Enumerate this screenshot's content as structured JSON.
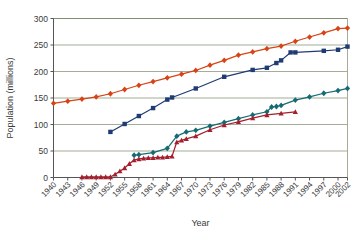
{
  "chart_data": {
    "type": "line",
    "title": "",
    "xlabel": "Year",
    "ylabel": "Population (millions)",
    "xlim": [
      1940,
      2002
    ],
    "ylim": [
      0,
      300
    ],
    "ytick_values": [
      0,
      50,
      100,
      150,
      200,
      250,
      300
    ],
    "ytick_labels": [
      "0",
      "50",
      "100",
      "150",
      "200",
      "250",
      "300"
    ],
    "xtick_labels": [
      "1940",
      "1943",
      "1946",
      "1949",
      "1952",
      "1955",
      "1958",
      "1961",
      "1964",
      "1967",
      "1970",
      "1973",
      "1976",
      "1979",
      "1982",
      "1985",
      "1988",
      "1991",
      "1994",
      "1997",
      "2000",
      "2002"
    ],
    "grid": "horizontal",
    "legend": "none",
    "series": [
      {
        "name": "series-red-diamond",
        "color": "#d84315",
        "marker": "diamond",
        "points": [
          [
            1940,
            140
          ],
          [
            1943,
            144
          ],
          [
            1946,
            148
          ],
          [
            1949,
            152
          ],
          [
            1952,
            158
          ],
          [
            1955,
            166
          ],
          [
            1958,
            174
          ],
          [
            1961,
            181
          ],
          [
            1964,
            188
          ],
          [
            1967,
            195
          ],
          [
            1970,
            202
          ],
          [
            1973,
            212
          ],
          [
            1976,
            221
          ],
          [
            1979,
            231
          ],
          [
            1982,
            237
          ],
          [
            1985,
            243
          ],
          [
            1988,
            248
          ],
          [
            1991,
            257
          ],
          [
            1994,
            265
          ],
          [
            1997,
            273
          ],
          [
            2000,
            281
          ],
          [
            2002,
            282
          ]
        ]
      },
      {
        "name": "series-navy-square",
        "color": "#1f3b73",
        "marker": "square",
        "points": [
          [
            1952,
            86
          ],
          [
            1955,
            101
          ],
          [
            1958,
            116
          ],
          [
            1961,
            131
          ],
          [
            1964,
            147
          ],
          [
            1965,
            151
          ],
          [
            1970,
            168
          ],
          [
            1976,
            190
          ],
          [
            1982,
            203
          ],
          [
            1985,
            207
          ],
          [
            1987,
            216
          ],
          [
            1988,
            221
          ],
          [
            1990,
            236
          ],
          [
            1991,
            236
          ],
          [
            1997,
            239
          ],
          [
            2000,
            241
          ],
          [
            2002,
            247
          ]
        ]
      },
      {
        "name": "series-teal-diamond",
        "color": "#146b73",
        "marker": "diamond",
        "points": [
          [
            1957,
            42
          ],
          [
            1958,
            43
          ],
          [
            1961,
            47
          ],
          [
            1964,
            55
          ],
          [
            1966,
            78
          ],
          [
            1968,
            86
          ],
          [
            1970,
            89
          ],
          [
            1973,
            97
          ],
          [
            1976,
            104
          ],
          [
            1979,
            111
          ],
          [
            1982,
            118
          ],
          [
            1985,
            124
          ],
          [
            1986,
            133
          ],
          [
            1987,
            134
          ],
          [
            1988,
            136
          ],
          [
            1991,
            146
          ],
          [
            1994,
            152
          ],
          [
            1997,
            159
          ],
          [
            2000,
            164
          ],
          [
            2002,
            168
          ]
        ]
      },
      {
        "name": "series-darkred-triangle",
        "color": "#a41f2e",
        "marker": "triangle",
        "points": [
          [
            1946,
            1
          ],
          [
            1947,
            1
          ],
          [
            1948,
            1
          ],
          [
            1949,
            1
          ],
          [
            1950,
            1
          ],
          [
            1951,
            1
          ],
          [
            1952,
            1
          ],
          [
            1953,
            6
          ],
          [
            1954,
            12
          ],
          [
            1955,
            18
          ],
          [
            1956,
            26
          ],
          [
            1957,
            33
          ],
          [
            1958,
            35
          ],
          [
            1959,
            36
          ],
          [
            1960,
            37
          ],
          [
            1961,
            37
          ],
          [
            1962,
            38
          ],
          [
            1963,
            38
          ],
          [
            1964,
            39
          ],
          [
            1965,
            40
          ],
          [
            1966,
            67
          ],
          [
            1967,
            70
          ],
          [
            1968,
            73
          ],
          [
            1970,
            78
          ],
          [
            1973,
            90
          ],
          [
            1976,
            99
          ],
          [
            1979,
            105
          ],
          [
            1982,
            112
          ],
          [
            1985,
            118
          ],
          [
            1988,
            121
          ],
          [
            1991,
            124
          ]
        ]
      }
    ]
  }
}
